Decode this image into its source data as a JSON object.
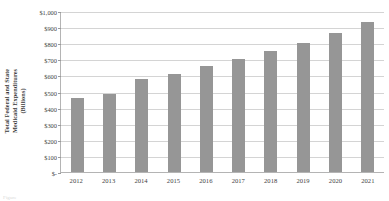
{
  "chart_data": {
    "type": "bar",
    "title": "",
    "subtitle": "",
    "xlabel": "",
    "ylabel": "Total Federal and State Medicaid Expenditures (Billions)",
    "ylabel_line1": "Total Federal and State",
    "ylabel_line2": "Medicaid Expenditures",
    "ylabel_line3": "(Billions)",
    "categories": [
      "2012",
      "2013",
      "2014",
      "2015",
      "2016",
      "2017",
      "2018",
      "2019",
      "2020",
      "2021"
    ],
    "values": [
      460,
      483,
      575,
      610,
      661,
      704,
      752,
      801,
      866,
      930
    ],
    "ylim": [
      0,
      1000
    ],
    "ytick_values": [
      0,
      100,
      200,
      300,
      400,
      500,
      600,
      700,
      800,
      900,
      1000
    ],
    "ytick_labels": [
      "$-",
      "$100",
      "$200",
      "$300",
      "$400",
      "$500",
      "$600",
      "$700",
      "$800",
      "$900",
      "$1,000"
    ],
    "grid": true,
    "grid_axis": "y",
    "legend": false,
    "legend_position": "none",
    "bar_color": "#969696",
    "gridline_color": "#d4d4d4",
    "axis_color": "#b4b4b4",
    "text_color": "#3f3f3f",
    "background": "#ffffff"
  },
  "caption": {
    "artifact_text": "Figure"
  }
}
